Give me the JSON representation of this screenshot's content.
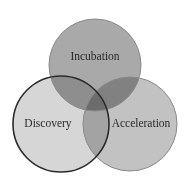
{
  "diagram": {
    "type": "venn",
    "background": "#ffffff",
    "circles": [
      {
        "id": "incubation",
        "label": "Incubation",
        "cx": 95,
        "cy": 65,
        "r": 46,
        "fill": "#a9a9a9",
        "stroke": "#8a8a8a",
        "stroke_width": 1,
        "label_x": 95,
        "label_y": 57
      },
      {
        "id": "discovery",
        "label": "Discovery",
        "cx": 61,
        "cy": 124,
        "r": 48,
        "fill": "#d6d6d6",
        "stroke": "#2b2b2b",
        "stroke_width": 1.6,
        "label_x": 48,
        "label_y": 124
      },
      {
        "id": "acceleration",
        "label": "Acceleration",
        "cx": 130,
        "cy": 124,
        "r": 47,
        "fill": "#c2c2c2",
        "stroke": "#8a8a8a",
        "stroke_width": 1,
        "label_x": 141,
        "label_y": 124
      }
    ]
  }
}
